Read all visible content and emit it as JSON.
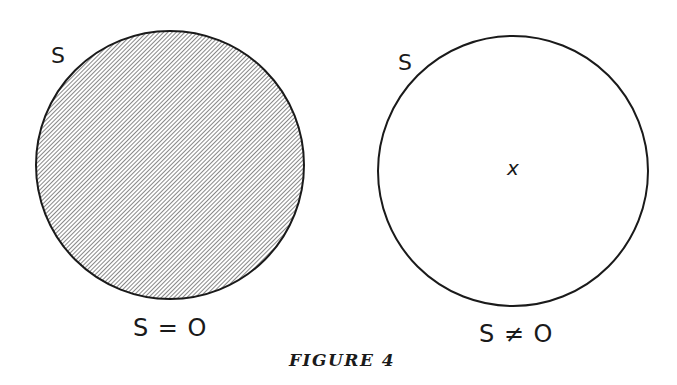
{
  "figure": {
    "caption": "FIGURE 4",
    "colors": {
      "stroke": "#1a1a1a",
      "hatch": "#555555",
      "background": "#ffffff"
    },
    "diagrams": [
      {
        "id": "left",
        "set_label": "S",
        "shaded": true,
        "element": "",
        "caption": "S = O"
      },
      {
        "id": "right",
        "set_label": "S",
        "shaded": false,
        "element": "x",
        "caption": "S ≠ O"
      }
    ]
  }
}
